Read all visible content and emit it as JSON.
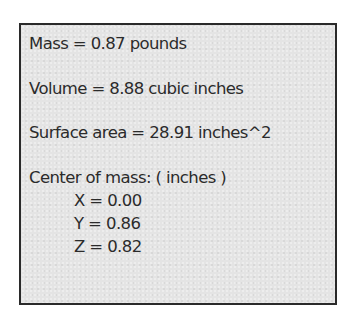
{
  "mass_properties": {
    "mass": "Mass = 0.87 pounds",
    "volume": "Volume = 8.88 cubic inches",
    "surface_area": "Surface area = 28.91 inches^2",
    "center_of_mass": {
      "label": "Center of mass: ( inches )",
      "x": "X = 0.00",
      "y": "Y = 0.86",
      "z": "Z = 0.82"
    }
  }
}
